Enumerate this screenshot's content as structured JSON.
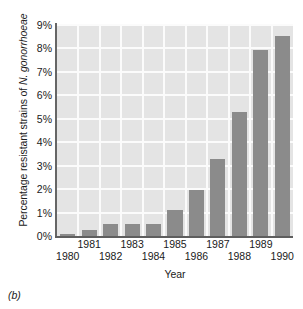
{
  "figure": {
    "caption": "(b)"
  },
  "chart_data": {
    "type": "bar",
    "title": "",
    "categories": [
      "1980",
      "1981",
      "1982",
      "1983",
      "1984",
      "1985",
      "1986",
      "1987",
      "1988",
      "1989",
      "1990"
    ],
    "values": [
      0.1,
      0.25,
      0.5,
      0.5,
      0.5,
      1.1,
      1.95,
      3.3,
      5.3,
      7.95,
      8.55
    ],
    "xlabel": "Year",
    "ylabel_prefix": "Percentage resistant strains of ",
    "ylabel_species": "N. gonorrhoeae",
    "ylabel": "Percentage resistant strains of N. gonorrhoeae",
    "ylim": [
      0,
      9
    ],
    "ytick_values": [
      0,
      1,
      2,
      3,
      4,
      5,
      6,
      7,
      8,
      9
    ],
    "ytick_labels": [
      "0%",
      "1%",
      "2%",
      "3%",
      "4%",
      "5%",
      "6%",
      "7%",
      "8%",
      "9%"
    ],
    "grid": true,
    "grid_color": "#fbfbfb",
    "plot_background": "#e4e4e4",
    "bar_color": "#8b8b8b",
    "axis_color": "#5e5e5e",
    "legend": null,
    "xtick_rows": {
      "top": [
        "1981",
        "1983",
        "1985",
        "1987",
        "1989"
      ],
      "bottom": [
        "1980",
        "1982",
        "1984",
        "1986",
        "1988",
        "1990"
      ]
    }
  }
}
